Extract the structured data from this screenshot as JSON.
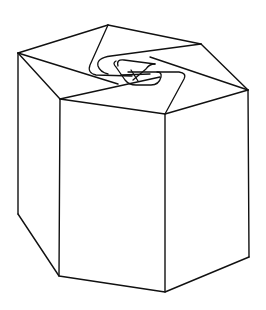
{
  "figure": {
    "title": "",
    "background": "#ffffff",
    "stroke_color": "#111111"
  }
}
